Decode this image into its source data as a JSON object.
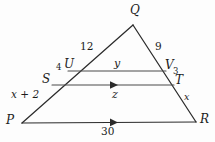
{
  "figure": {
    "kind": "geometry-diagram",
    "shape": "triangle",
    "background_color": "#fdfdfd",
    "stroke_color": "#2b2b2b",
    "label_color": "#1c1c1c"
  },
  "vertices": [
    {
      "id": "Q",
      "label": "Q",
      "x": 133,
      "y": 25,
      "label_x": 130,
      "label_y": 4
    },
    {
      "id": "P",
      "label": "P",
      "x": 22,
      "y": 123,
      "label_x": 6,
      "label_y": 114
    },
    {
      "id": "R",
      "label": "R",
      "x": 196,
      "y": 122,
      "label_x": 200,
      "label_y": 113
    }
  ],
  "points": [
    {
      "id": "U",
      "label": "U",
      "x": 68,
      "y": 71,
      "label_x": 64,
      "label_y": 58
    },
    {
      "id": "S",
      "label": "S",
      "x": 52,
      "y": 85,
      "label_x": 42,
      "label_y": 73
    },
    {
      "id": "V",
      "label": "V",
      "x": 166,
      "y": 71,
      "label_x": 165,
      "label_y": 59
    },
    {
      "id": "T",
      "label": "T",
      "x": 174,
      "y": 85,
      "label_x": 175,
      "label_y": 74
    }
  ],
  "sides": [
    {
      "id": "PQ",
      "from": "P",
      "to": "Q"
    },
    {
      "id": "QR",
      "from": "Q",
      "to": "R"
    },
    {
      "id": "PR",
      "from": "P",
      "to": "R",
      "has_arrow_marker": true
    }
  ],
  "interior_segments": [
    {
      "id": "UV",
      "from": "U",
      "to": "V",
      "has_arrow_marker": false
    },
    {
      "id": "ST",
      "from": "S",
      "to": "T",
      "has_arrow_marker": true
    }
  ],
  "measure_labels": [
    {
      "id": "QU",
      "text": "12",
      "x": 80,
      "y": 41,
      "style": "seg-num"
    },
    {
      "id": "QV",
      "text": "9",
      "x": 155,
      "y": 41,
      "style": "seg-num"
    },
    {
      "id": "US",
      "text": "4",
      "x": 56,
      "y": 63,
      "style": "small-num"
    },
    {
      "id": "VT",
      "text": "3",
      "x": 173,
      "y": 67,
      "style": "small-num"
    },
    {
      "id": "UV",
      "text": "y",
      "x": 114,
      "y": 58,
      "style": "seg-var"
    },
    {
      "id": "ST",
      "text": "z",
      "x": 112,
      "y": 89,
      "style": "seg-var"
    },
    {
      "id": "SP",
      "text": "x + 2",
      "x": 11,
      "y": 89,
      "style": "seg-expr"
    },
    {
      "id": "TR",
      "text": "x",
      "x": 184,
      "y": 92,
      "style": "small-var"
    },
    {
      "id": "PR",
      "text": "30",
      "x": 101,
      "y": 126,
      "style": "seg-num"
    }
  ]
}
